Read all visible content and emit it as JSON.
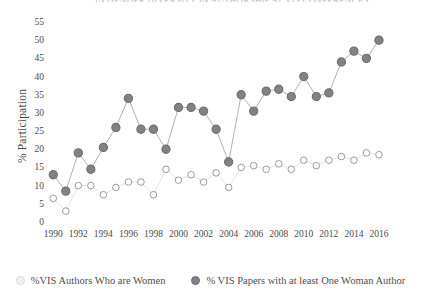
{
  "chart": {
    "title_partial": "IN GENDER DIVERSITY IN AUTHORSHIP AT VIS CONFERENCES",
    "ylabel": "% Participation",
    "xlabel": "Year"
  },
  "legend": {
    "position": "bottom",
    "entries": [
      {
        "name": "open-circle-series",
        "label": "%VIS Authors Who are Women",
        "color": "#f2f2f2",
        "marker": "open-circle"
      },
      {
        "name": "filled-circle-series",
        "label": "% VIS Papers with at least One Woman Author",
        "color": "#828282",
        "marker": "filled-circle"
      }
    ]
  },
  "chart_data": {
    "type": "line",
    "title": "",
    "xlabel": "Year",
    "ylabel": "% Participation",
    "xlim": [
      1989.5,
      2016.8
    ],
    "ylim": [
      0,
      55
    ],
    "yticks": [
      0,
      5,
      10,
      15,
      20,
      25,
      30,
      35,
      40,
      45,
      50,
      55
    ],
    "xticks": [
      1990,
      1992,
      1994,
      1996,
      1998,
      2000,
      2002,
      2004,
      2006,
      2008,
      2010,
      2012,
      2014,
      2016
    ],
    "grid": false,
    "x": [
      1990,
      1991,
      1992,
      1993,
      1994,
      1995,
      1996,
      1997,
      1998,
      1999,
      2000,
      2001,
      2002,
      2003,
      2004,
      2005,
      2006,
      2007,
      2008,
      2009,
      2010,
      2011,
      2012,
      2013,
      2014,
      2015,
      2016
    ],
    "series": [
      {
        "name": "% VIS Papers with at least One Woman Author",
        "marker": "filled-circle",
        "color": "#828282",
        "values": [
          13,
          8.5,
          19,
          14.5,
          20.5,
          26,
          34,
          25.5,
          25.5,
          20,
          31.5,
          31.5,
          30.5,
          25.5,
          16.5,
          35,
          30.5,
          36,
          36.5,
          34.5,
          40,
          34.5,
          35.5,
          44,
          47,
          45,
          50
        ]
      },
      {
        "name": "%VIS Authors Who are Women",
        "marker": "open-circle",
        "color": "#ffffff",
        "values": [
          6.5,
          3,
          10,
          10,
          7.5,
          9.5,
          11,
          11,
          7.5,
          14.5,
          11.5,
          13,
          11,
          13.5,
          9.5,
          15,
          15.5,
          14.5,
          16,
          14.5,
          17,
          15.5,
          17,
          18,
          17,
          19,
          18.5
        ]
      }
    ]
  },
  "colors": {
    "filled_marker": "#828282",
    "filled_marker_edge": "#6e6e6e",
    "open_marker_edge": "#9a9a9a",
    "line": "#a8a8a8",
    "text": "#4a4a4a"
  }
}
